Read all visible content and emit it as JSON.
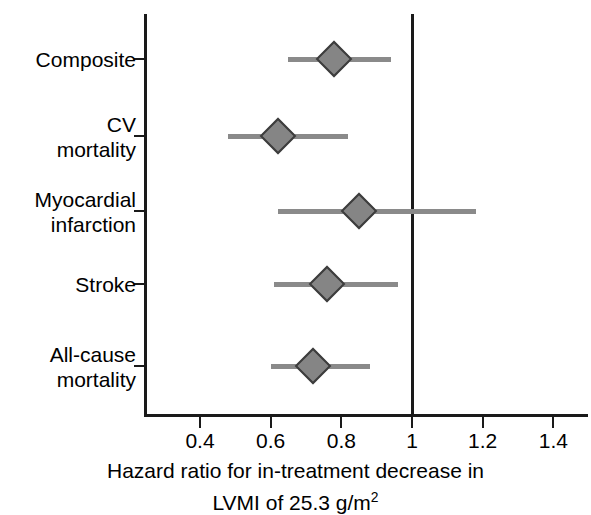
{
  "chart_data": {
    "type": "scatter",
    "plot_style": "forest-plot",
    "title": "",
    "xlabel_line1": "Hazard ratio for in-treatment decrease in",
    "xlabel_line2_prefix": "LVMI of 25.3 g/m",
    "xlabel_line2_sup": "2",
    "ylabel": "",
    "xlim": [
      0.28,
      1.53
    ],
    "xticks": [
      0.4,
      0.6,
      0.8,
      1.0,
      1.2,
      1.4
    ],
    "xticklabels": [
      "0.4",
      "0.6",
      "0.8",
      "1",
      "1.2",
      "1.4"
    ],
    "reference_line": 1.0,
    "grid": false,
    "legend": "none",
    "marker_shape": "diamond",
    "marker_color": "#858585",
    "marker_edge_color": "#3d3d3d",
    "ci_line_color": "#8a8a8a",
    "axis_color": "#1a1a1a",
    "categories": [
      "Composite",
      "CV\nmortality",
      "Myocardial\ninfarction",
      "Stroke",
      "All-cause\nmortality"
    ],
    "points": [
      {
        "label": "Composite",
        "hazard_ratio": 0.78,
        "ci_low": 0.65,
        "ci_high": 0.94
      },
      {
        "label": "CV mortality",
        "hazard_ratio": 0.62,
        "ci_low": 0.48,
        "ci_high": 0.82
      },
      {
        "label": "Myocardial infarction",
        "hazard_ratio": 0.85,
        "ci_low": 0.62,
        "ci_high": 1.18
      },
      {
        "label": "Stroke",
        "hazard_ratio": 0.76,
        "ci_low": 0.61,
        "ci_high": 0.96
      },
      {
        "label": "All-cause mortality",
        "hazard_ratio": 0.72,
        "ci_low": 0.6,
        "ci_high": 0.88
      }
    ]
  }
}
